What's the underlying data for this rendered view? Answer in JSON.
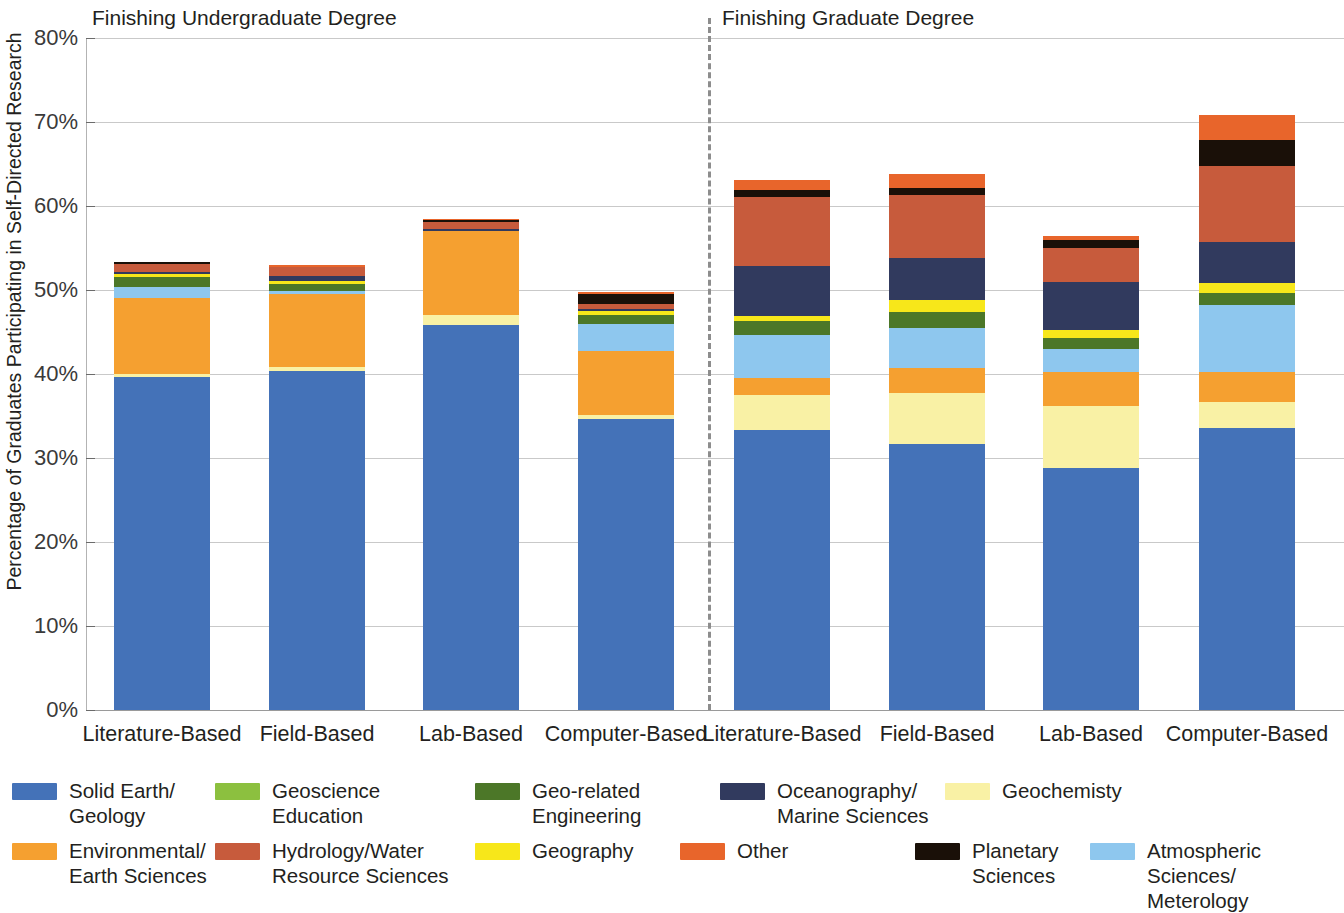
{
  "chart_data": {
    "type": "bar",
    "subtype": "stacked-bar",
    "title": "",
    "xlabel": "",
    "ylabel": "Percentage of Graduates Participating in Self-Directed Research",
    "ylim": [
      0,
      80
    ],
    "y_tick_labels": [
      "0%",
      "10%",
      "20%",
      "30%",
      "40%",
      "50%",
      "60%",
      "70%",
      "80%"
    ],
    "y_tick_values": [
      0,
      10,
      20,
      30,
      40,
      50,
      60,
      70,
      80
    ],
    "grid": true,
    "legend_position": "bottom",
    "group_titles": [
      "Finishing Undergraduate Degree",
      "Finishing Graduate Degree"
    ],
    "categories": [
      "Literature-Based",
      "Field-Based",
      "Lab-Based",
      "Computer-Based",
      "Literature-Based",
      "Field-Based",
      "Lab-Based",
      "Computer-Based"
    ],
    "series": [
      {
        "name": "Solid Earth/\nGeology",
        "color": "#4472b8",
        "values": [
          39.6,
          40.3,
          45.8,
          34.6,
          33.3,
          31.7,
          28.8,
          33.6
        ]
      },
      {
        "name": "Geochemisty",
        "color": "#f9f1a5",
        "values": [
          0.4,
          0.5,
          1.2,
          0.5,
          4.2,
          6.0,
          7.4,
          3.1
        ]
      },
      {
        "name": "Environmental/\nEarth Sciences",
        "color": "#f5a030",
        "values": [
          9.1,
          8.7,
          10.0,
          7.7,
          2.0,
          3.0,
          4.1,
          3.6
        ]
      },
      {
        "name": "Atmospheric Sciences/\nMeterology",
        "color": "#8ec7ee",
        "values": [
          1.3,
          0.4,
          0.0,
          3.2,
          5.2,
          4.8,
          2.7,
          7.9
        ]
      },
      {
        "name": "Geo-related\nEngineering",
        "color": "#4c7728",
        "values": [
          1.1,
          0.8,
          0.0,
          1.0,
          1.6,
          1.9,
          1.3,
          1.4
        ]
      },
      {
        "name": "Geography",
        "color": "#f7e71a",
        "values": [
          0.4,
          0.4,
          0.0,
          0.5,
          0.6,
          1.4,
          1.0,
          1.2
        ]
      },
      {
        "name": "Oceanography/\nMarine Sciences",
        "color": "#313a5e",
        "values": [
          0.3,
          0.6,
          0.3,
          0.3,
          6.0,
          5.0,
          5.7,
          4.9
        ]
      },
      {
        "name": "Hydrology/Water\nResource Sciences",
        "color": "#c75b3c",
        "values": [
          0.9,
          1.0,
          0.8,
          0.6,
          8.2,
          7.5,
          4.0,
          9.1
        ]
      },
      {
        "name": "Planetary\nSciences",
        "color": "#1a1008",
        "values": [
          0.3,
          0.1,
          0.2,
          1.1,
          0.8,
          0.8,
          1.0,
          3.1
        ]
      },
      {
        "name": "Other",
        "color": "#e8652b",
        "values": [
          0.0,
          0.2,
          0.2,
          0.3,
          1.2,
          1.7,
          0.4,
          2.9
        ]
      }
    ],
    "bar_totals": [
      53.4,
      53.0,
      58.5,
      49.8,
      62.5,
      63.0,
      56.4,
      70.8
    ]
  },
  "axis": {
    "y_title": "Percentage of Graduates Participating in Self-Directed Research",
    "ticks": [
      "80%",
      "70%",
      "60%",
      "50%",
      "40%",
      "30%",
      "20%",
      "10%",
      "0%"
    ]
  },
  "groups": {
    "left_title": "Finishing Undergraduate Degree",
    "right_title": "Finishing Graduate Degree"
  },
  "x_labels": [
    "Literature-Based",
    "Field-Based",
    "Lab-Based",
    "Computer-Based",
    "Literature-Based",
    "Field-Based",
    "Lab-Based",
    "Computer-Based"
  ],
  "legend": {
    "items": [
      {
        "label": "Solid Earth/\nGeology",
        "color": "#4472b8",
        "icon": "legend-swatch-solid-earth-geology"
      },
      {
        "label": "Geoscience\nEducation",
        "color": "#8cc03f",
        "icon": "legend-swatch-geoscience-education"
      },
      {
        "label": "Geo-related\nEngineering",
        "color": "#4c7728",
        "icon": "legend-swatch-geo-related-engineering"
      },
      {
        "label": "Oceanography/\nMarine Sciences",
        "color": "#313a5e",
        "icon": "legend-swatch-oceanography-marine-sciences"
      },
      {
        "label": "Geochemisty",
        "color": "#f9f1a5",
        "icon": "legend-swatch-geochemisty"
      },
      {
        "label": "Environmental/\nEarth Sciences",
        "color": "#f5a030",
        "icon": "legend-swatch-environmental-earth-sciences"
      },
      {
        "label": "Hydrology/Water\nResource Sciences",
        "color": "#c75b3c",
        "icon": "legend-swatch-hydrology-water-resource-sciences"
      },
      {
        "label": "Geography",
        "color": "#f7e71a",
        "icon": "legend-swatch-geography"
      },
      {
        "label": "Other",
        "color": "#e8652b",
        "icon": "legend-swatch-other"
      },
      {
        "label": "Planetary\nSciences",
        "color": "#1a1008",
        "icon": "legend-swatch-planetary-sciences"
      },
      {
        "label": "Atmospheric Sciences/\nMeterology",
        "color": "#8ec7ee",
        "icon": "legend-swatch-atmospheric-sciences-meterology"
      }
    ]
  },
  "colors": {
    "grid": "#c9c9c9",
    "axis": "#9a9a9a",
    "divider": "#8d8d8d",
    "text": "#231f20",
    "background": "#ffffff"
  }
}
